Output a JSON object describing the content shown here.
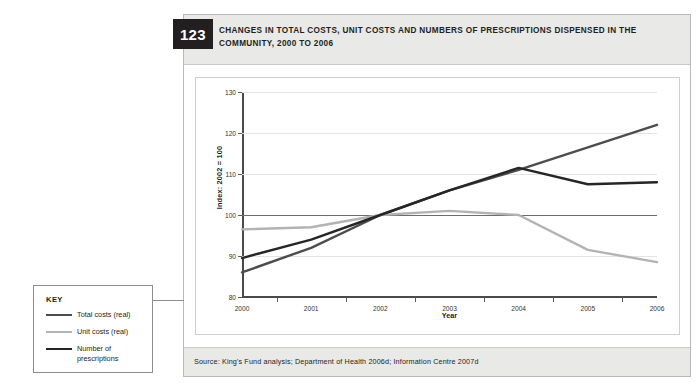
{
  "figure": {
    "number": "123",
    "title": "CHANGES IN TOTAL COSTS, UNIT COSTS AND NUMBERS OF PRESCRIPTIONS DISPENSED IN THE COMMUNITY, 2000 TO 2006",
    "source": "Source: King's Fund analysis; Department of Health 2006d; Information Centre 2007d"
  },
  "key": {
    "title": "KEY",
    "items": [
      {
        "label": "Total costs (real)",
        "color": "#4d4d4d"
      },
      {
        "label": "Unit costs (real)",
        "color": "#b3b3b3"
      },
      {
        "label": "Number of\nprescriptions",
        "color": "#262626"
      }
    ]
  },
  "chart_data": {
    "type": "line",
    "title": "CHANGES IN TOTAL COSTS, UNIT COSTS AND NUMBERS OF PRESCRIPTIONS DISPENSED IN THE COMMUNITY, 2000 TO 2006",
    "xlabel": "Year",
    "ylabel": "Index: 2002 = 100",
    "categories": [
      "2000",
      "2001",
      "2002",
      "2003",
      "2004",
      "2005",
      "2006"
    ],
    "ylim": [
      80,
      130
    ],
    "yticks": [
      80,
      90,
      100,
      110,
      120,
      130
    ],
    "grid": true,
    "reference_line": 100,
    "legend_position": "outside-left",
    "series": [
      {
        "name": "Total costs (real)",
        "color": "#4d4d4d",
        "values": [
          86.0,
          92.0,
          100.0,
          106.0,
          111.0,
          116.5,
          122.0
        ]
      },
      {
        "name": "Unit costs (real)",
        "color": "#b3b3b3",
        "values": [
          96.5,
          97.0,
          100.0,
          101.0,
          100.0,
          91.5,
          88.5
        ]
      },
      {
        "name": "Number of prescriptions",
        "color": "#262626",
        "values": [
          89.5,
          94.0,
          100.0,
          106.0,
          111.5,
          107.5,
          108.0
        ]
      }
    ]
  }
}
